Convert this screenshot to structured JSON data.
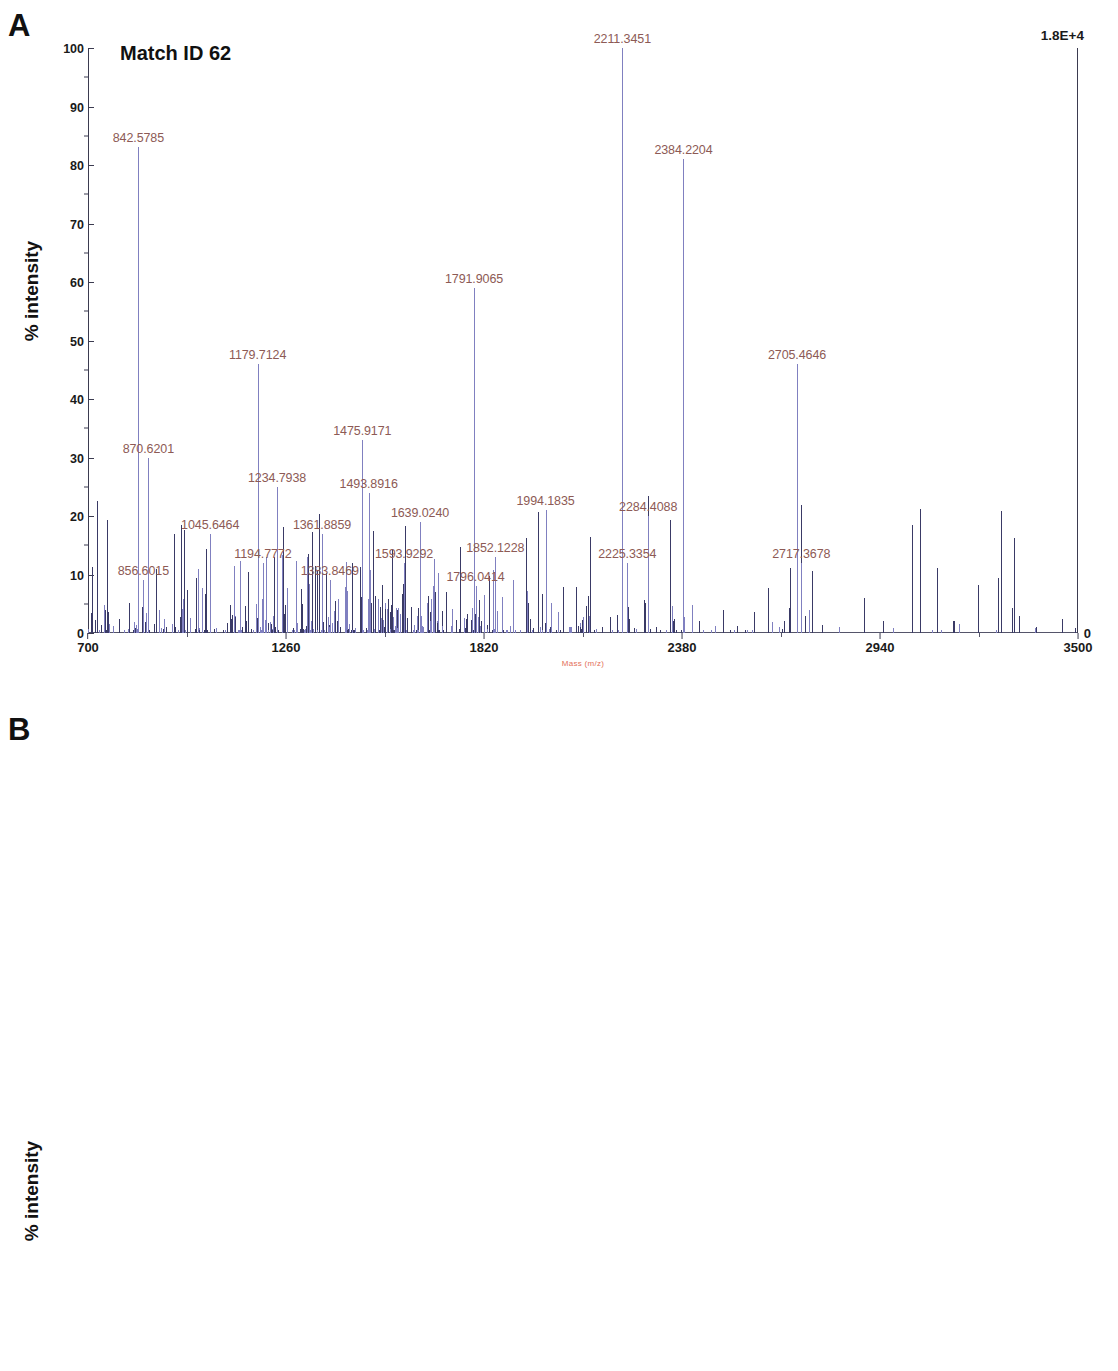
{
  "figure": {
    "panels": [
      {
        "letter": "A",
        "title": "Match ID 62",
        "ylabel": "% intensity",
        "xlabel": "Mass (m/z)",
        "intensity_max_label": "1.8E+4",
        "right_zero": "0",
        "yticks": [
          "100",
          "90",
          "80",
          "70",
          "60",
          "50",
          "40",
          "30",
          "20",
          "10",
          "0"
        ],
        "xticks": [
          "700",
          "1260",
          "1820",
          "2380",
          "2940",
          "3500"
        ]
      },
      {
        "letter": "B",
        "title": "Match ID 66",
        "ylabel": "% intensity",
        "xlabel": "",
        "intensity_max_label": "2.1E+4",
        "right_zero": "0",
        "yticks": [
          "100",
          "90",
          "80",
          "70",
          "60",
          "50",
          "40",
          "30",
          "20",
          "10",
          "0"
        ],
        "xticks": [
          "600",
          "1080",
          "1560",
          "2040",
          "2520",
          "3000"
        ]
      }
    ]
  },
  "chart_data": [
    {
      "type": "line",
      "id": "panel-a-spectrum",
      "title": "Match ID 62",
      "xlabel": "Mass (m/z)",
      "ylabel": "% intensity",
      "xlim": [
        700,
        3500
      ],
      "ylim": [
        0,
        100
      ],
      "grid": false,
      "legend": null,
      "annotation_intensity": "1.8E+4",
      "labeled_peaks": [
        {
          "mz": 842.5785,
          "intensity": 83,
          "label": "842.5785"
        },
        {
          "mz": 856.6015,
          "intensity": 9,
          "label": "856.6015"
        },
        {
          "mz": 870.6201,
          "intensity": 30,
          "label": "870.6201"
        },
        {
          "mz": 1045.6464,
          "intensity": 17,
          "label": "1045.6464"
        },
        {
          "mz": 1179.7124,
          "intensity": 46,
          "label": "1179.7124"
        },
        {
          "mz": 1194.7772,
          "intensity": 12,
          "label": "1194.7772"
        },
        {
          "mz": 1234.7938,
          "intensity": 25,
          "label": "1234.7938"
        },
        {
          "mz": 1361.8859,
          "intensity": 17,
          "label": "1361.8859"
        },
        {
          "mz": 1383.8469,
          "intensity": 9,
          "label": "1383.8469"
        },
        {
          "mz": 1475.9171,
          "intensity": 33,
          "label": "1475.9171"
        },
        {
          "mz": 1493.8916,
          "intensity": 24,
          "label": "1493.8916"
        },
        {
          "mz": 1593.9292,
          "intensity": 12,
          "label": "1593.9292"
        },
        {
          "mz": 1639.024,
          "intensity": 19,
          "label": "1639.0240"
        },
        {
          "mz": 1791.9065,
          "intensity": 59,
          "label": "1791.9065"
        },
        {
          "mz": 1796.0414,
          "intensity": 8,
          "label": "1796.0414"
        },
        {
          "mz": 1852.1228,
          "intensity": 13,
          "label": "1852.1228"
        },
        {
          "mz": 1994.1835,
          "intensity": 21,
          "label": "1994.1835"
        },
        {
          "mz": 2211.3451,
          "intensity": 100,
          "label": "2211.3451"
        },
        {
          "mz": 2225.3354,
          "intensity": 12,
          "label": "2225.3354"
        },
        {
          "mz": 2284.4088,
          "intensity": 20,
          "label": "2284.4088"
        },
        {
          "mz": 2384.2204,
          "intensity": 81,
          "label": "2384.2204"
        },
        {
          "mz": 2705.4646,
          "intensity": 46,
          "label": "2705.4646"
        },
        {
          "mz": 2717.3678,
          "intensity": 12,
          "label": "2717.3678"
        }
      ]
    },
    {
      "type": "line",
      "id": "panel-b-spectrum",
      "title": "Match ID 66",
      "xlabel": "Mass (m/z)",
      "ylabel": "% intensity",
      "xlim": [
        600,
        3000
      ],
      "ylim": [
        0,
        100
      ],
      "grid": false,
      "legend": null,
      "annotation_intensity": "2.1E+4",
      "labeled_peaks": [
        {
          "mz": 670.3741,
          "intensity": 42,
          "label": "670.3741"
        },
        {
          "mz": 842.5721,
          "intensity": 31,
          "label": "842.5721"
        },
        {
          "mz": 870.6072,
          "intensity": 9,
          "label": "870.6072"
        },
        {
          "mz": 1045.6634,
          "intensity": 11,
          "label": "1045.6634"
        },
        {
          "mz": 1105.6799,
          "intensity": 30,
          "label": "1105.6799"
        },
        {
          "mz": 1118.686,
          "intensity": 51,
          "label": "1118.6860"
        },
        {
          "mz": 1180.7407,
          "intensity": 18,
          "label": "1180.7407"
        },
        {
          "mz": 1296.8062,
          "intensity": 23,
          "label": "1296.8062"
        },
        {
          "mz": 1329.8202,
          "intensity": 58,
          "label": "1329.8202"
        },
        {
          "mz": 1341.8265,
          "intensity": 100,
          "label": "1341.8265"
        },
        {
          "mz": 1386.9092,
          "intensity": 11,
          "label": "1386.9092"
        },
        {
          "mz": 1435.8399,
          "intensity": 36,
          "label": "1435.8399"
        },
        {
          "mz": 1459.8388,
          "intensity": 42,
          "label": "1459.8388"
        },
        {
          "mz": 1473.8398,
          "intensity": 18,
          "label": "1473.8398"
        },
        {
          "mz": 1561.9086,
          "intensity": 29,
          "label": "1561.9086"
        },
        {
          "mz": 1629.9787,
          "intensity": 70,
          "label": "1629.9787"
        },
        {
          "mz": 1649.977,
          "intensity": 17,
          "label": "1649.9770"
        },
        {
          "mz": 1654.9757,
          "intensity": 11,
          "label": "1654.9757"
        },
        {
          "mz": 1711.085,
          "intensity": 33,
          "label": "1711.0850"
        },
        {
          "mz": 1800.972,
          "intensity": 37,
          "label": "1800.9720"
        },
        {
          "mz": 1817.0168,
          "intensity": 21,
          "label": "1817.0168"
        },
        {
          "mz": 1952.123,
          "intensity": 11,
          "label": "1952.1230"
        },
        {
          "mz": 2013.1996,
          "intensity": 17,
          "label": "2013.1996"
        },
        {
          "mz": 2057.2286,
          "intensity": 29,
          "label": "2057.2286"
        },
        {
          "mz": 2131.3355,
          "intensity": 55,
          "label": "2131.3355"
        },
        {
          "mz": 2211.3238,
          "intensity": 84,
          "label": "2211.3238"
        },
        {
          "mz": 2318.5237,
          "intensity": 12,
          "label": "2318.5237"
        },
        {
          "mz": 2384.1987,
          "intensity": 22,
          "label": "2384.1987"
        },
        {
          "mz": 2498.5193,
          "intensity": 19,
          "label": "2498.5193"
        },
        {
          "mz": 2705.4897,
          "intensity": 55,
          "label": "2705.4897"
        },
        {
          "mz": 2767.5784,
          "intensity": 10,
          "label": "2767.5784"
        }
      ]
    }
  ]
}
